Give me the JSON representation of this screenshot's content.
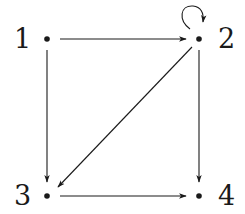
{
  "diagram": {
    "type": "directed-graph",
    "nodes": [
      {
        "id": "1",
        "label": "1",
        "x": 47,
        "y": 39
      },
      {
        "id": "2",
        "label": "2",
        "x": 199,
        "y": 39
      },
      {
        "id": "3",
        "label": "3",
        "x": 47,
        "y": 196
      },
      {
        "id": "4",
        "label": "4",
        "x": 199,
        "y": 196
      }
    ],
    "edges": [
      {
        "from": "1",
        "to": "2"
      },
      {
        "from": "1",
        "to": "3"
      },
      {
        "from": "2",
        "to": "2",
        "self_loop": true
      },
      {
        "from": "2",
        "to": "3"
      },
      {
        "from": "2",
        "to": "4"
      },
      {
        "from": "3",
        "to": "4"
      }
    ],
    "color": "#1a1a1a"
  }
}
